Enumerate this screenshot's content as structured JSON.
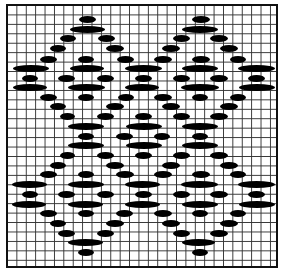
{
  "diagram": {
    "type": "knitting-chart",
    "grid": {
      "columns": 29,
      "rows": 28,
      "line_color": "#333333",
      "border_color": "#111111"
    },
    "dash_color": "#000000",
    "dash_height": 7,
    "rows": [
      {
        "y": 19,
        "spans": [
          [
            79,
            96
          ],
          [
            192,
            210
          ]
        ]
      },
      {
        "y": 29,
        "spans": [
          [
            70,
            105
          ],
          [
            182,
            218
          ]
        ]
      },
      {
        "y": 38,
        "spans": [
          [
            60,
            76
          ],
          [
            98,
            115
          ],
          [
            173,
            190
          ],
          [
            210,
            228
          ]
        ]
      },
      {
        "y": 48,
        "spans": [
          [
            50,
            66
          ],
          [
            106,
            124
          ],
          [
            162,
            180
          ],
          [
            220,
            238
          ]
        ]
      },
      {
        "y": 59,
        "spans": [
          [
            40,
            57
          ],
          [
            78,
            94
          ],
          [
            117,
            134
          ],
          [
            154,
            172
          ],
          [
            192,
            210
          ],
          [
            230,
            246
          ]
        ]
      },
      {
        "y": 68,
        "spans": [
          [
            13,
            49
          ],
          [
            70,
            104
          ],
          [
            125,
            162
          ],
          [
            182,
            218
          ],
          [
            238,
            275
          ]
        ]
      },
      {
        "y": 78,
        "spans": [
          [
            22,
            38
          ],
          [
            58,
            75
          ],
          [
            97,
            114
          ],
          [
            135,
            152
          ],
          [
            173,
            190
          ],
          [
            210,
            228
          ],
          [
            248,
            265
          ]
        ]
      },
      {
        "y": 87,
        "spans": [
          [
            13,
            47
          ],
          [
            68,
            105
          ],
          [
            125,
            159
          ],
          [
            181,
            219
          ],
          [
            239,
            275
          ]
        ]
      },
      {
        "y": 97,
        "spans": [
          [
            40,
            57
          ],
          [
            78,
            94
          ],
          [
            118,
            134
          ],
          [
            154,
            172
          ],
          [
            192,
            208
          ],
          [
            230,
            246
          ]
        ]
      },
      {
        "y": 106,
        "spans": [
          [
            50,
            66
          ],
          [
            106,
            124
          ],
          [
            162,
            180
          ],
          [
            220,
            238
          ]
        ]
      },
      {
        "y": 116,
        "spans": [
          [
            60,
            75
          ],
          [
            97,
            114
          ],
          [
            135,
            152
          ],
          [
            173,
            190
          ],
          [
            210,
            228
          ]
        ]
      },
      {
        "y": 126,
        "spans": [
          [
            68,
            104
          ],
          [
            126,
            162
          ],
          [
            182,
            218
          ]
        ]
      },
      {
        "y": 136,
        "spans": [
          [
            78,
            94
          ],
          [
            116,
            133
          ],
          [
            154,
            170
          ],
          [
            192,
            208
          ]
        ]
      },
      {
        "y": 145,
        "spans": [
          [
            68,
            104
          ],
          [
            126,
            162
          ],
          [
            182,
            218
          ]
        ]
      },
      {
        "y": 155,
        "spans": [
          [
            60,
            75
          ],
          [
            97,
            114
          ],
          [
            135,
            152
          ],
          [
            173,
            190
          ],
          [
            210,
            228
          ]
        ]
      },
      {
        "y": 165,
        "spans": [
          [
            50,
            66
          ],
          [
            106,
            124
          ],
          [
            162,
            180
          ],
          [
            220,
            238
          ]
        ]
      },
      {
        "y": 174,
        "spans": [
          [
            40,
            57
          ],
          [
            78,
            94
          ],
          [
            116,
            134
          ],
          [
            154,
            172
          ],
          [
            192,
            210
          ],
          [
            230,
            246
          ]
        ]
      },
      {
        "y": 184,
        "spans": [
          [
            12,
            47
          ],
          [
            68,
            104
          ],
          [
            125,
            160
          ],
          [
            181,
            218
          ],
          [
            238,
            275
          ]
        ]
      },
      {
        "y": 194,
        "spans": [
          [
            22,
            38
          ],
          [
            58,
            75
          ],
          [
            97,
            114
          ],
          [
            135,
            152
          ],
          [
            173,
            190
          ],
          [
            210,
            228
          ],
          [
            248,
            265
          ]
        ]
      },
      {
        "y": 204,
        "spans": [
          [
            12,
            46
          ],
          [
            68,
            103
          ],
          [
            125,
            160
          ],
          [
            182,
            218
          ],
          [
            239,
            275
          ]
        ]
      },
      {
        "y": 213,
        "spans": [
          [
            40,
            57
          ],
          [
            78,
            94
          ],
          [
            116,
            133
          ],
          [
            154,
            172
          ],
          [
            192,
            208
          ],
          [
            230,
            246
          ]
        ]
      },
      {
        "y": 223,
        "spans": [
          [
            50,
            66
          ],
          [
            106,
            124
          ],
          [
            162,
            180
          ],
          [
            220,
            238
          ]
        ]
      },
      {
        "y": 233,
        "spans": [
          [
            58,
            75
          ],
          [
            97,
            114
          ],
          [
            173,
            190
          ],
          [
            210,
            228
          ]
        ]
      },
      {
        "y": 242,
        "spans": [
          [
            68,
            103
          ],
          [
            182,
            215
          ]
        ]
      },
      {
        "y": 252,
        "spans": [
          [
            78,
            94
          ],
          [
            192,
            208
          ]
        ]
      }
    ]
  }
}
